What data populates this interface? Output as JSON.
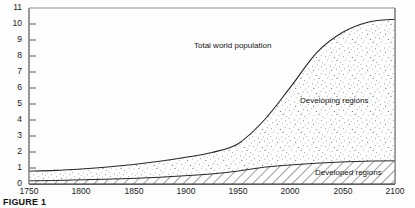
{
  "caption": "FIGURE 1",
  "chart_data": {
    "type": "area",
    "title": "",
    "xlabel": "",
    "ylabel": "",
    "xlim": [
      1750,
      2100
    ],
    "ylim": [
      0,
      11
    ],
    "grid": false,
    "legend_position": "inline-annotations",
    "xticks": [
      1750,
      1800,
      1850,
      1900,
      1950,
      2000,
      2050,
      2100
    ],
    "yticks": [
      0,
      1,
      2,
      3,
      4,
      5,
      6,
      7,
      8,
      9,
      10,
      11
    ],
    "annotations": [
      {
        "text": "Total world population",
        "x": 1950,
        "y": 8.7
      },
      {
        "text": "Developing regions",
        "x": 2020,
        "y": 5.3
      },
      {
        "text": "Developed regions",
        "x": 2040,
        "y": 0.8
      }
    ],
    "x": [
      1750,
      1775,
      1800,
      1825,
      1850,
      1875,
      1900,
      1925,
      1950,
      1975,
      2000,
      2025,
      2050,
      2075,
      2100
    ],
    "series": [
      {
        "name": "Developed regions",
        "fill": "hatch-diagonal",
        "values": [
          0.2,
          0.22,
          0.26,
          0.3,
          0.35,
          0.42,
          0.52,
          0.63,
          0.81,
          1.05,
          1.19,
          1.3,
          1.38,
          1.43,
          1.45
        ]
      },
      {
        "name": "Developing regions",
        "fill": "stipple-dots",
        "values": [
          0.6,
          0.63,
          0.68,
          0.76,
          0.87,
          1.0,
          1.15,
          1.34,
          1.71,
          2.95,
          4.86,
          6.9,
          8.1,
          8.7,
          8.85
        ]
      },
      {
        "name": "Total world population",
        "fill": "none",
        "values": [
          0.8,
          0.85,
          0.94,
          1.06,
          1.22,
          1.42,
          1.67,
          1.97,
          2.52,
          4.0,
          6.05,
          8.2,
          9.48,
          10.13,
          10.3
        ]
      }
    ]
  }
}
